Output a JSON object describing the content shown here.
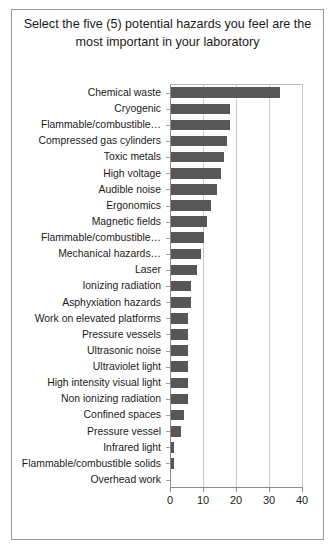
{
  "chart_data": {
    "type": "bar",
    "orientation": "horizontal",
    "title": "Select the five (5) potential hazards you feel are the most important in your laboratory",
    "xlabel": "",
    "ylabel": "",
    "xlim": [
      0,
      40
    ],
    "xticks": [
      "0",
      "10",
      "20",
      "30",
      "40"
    ],
    "grid": true,
    "legend": false,
    "bar_color": "#575757",
    "frame_color": "#9a9a9a",
    "categories": [
      "Chemical waste",
      "Cryogenic",
      "Flammable/combustible…",
      "Compressed gas cylinders",
      "Toxic metals",
      "High voltage",
      "Audible noise",
      "Ergonomics",
      "Magnetic fields",
      "Flammable/combustible…",
      "Mechanical hazards…",
      "Laser",
      "Ionizing radiation",
      "Asphyxiation hazards",
      "Work on elevated platforms",
      "Pressure vessels",
      "Ultrasonic noise",
      "Ultraviolet light",
      "High intensity visual light",
      "Non ionizing radiation",
      "Confined spaces",
      "Pressure vessel",
      "Infrared light",
      "Flammable/combustible solids",
      "Overhead work"
    ],
    "values": [
      33,
      18,
      18,
      17,
      16,
      15,
      14,
      12,
      11,
      10,
      9,
      8,
      6,
      6,
      5,
      5,
      5,
      5,
      5,
      5,
      4,
      3,
      1,
      1,
      0
    ]
  }
}
